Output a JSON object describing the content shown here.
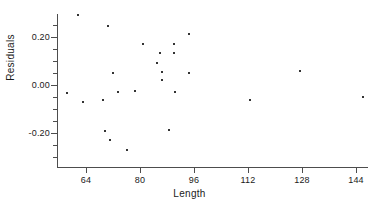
{
  "chart_data": {
    "type": "scatter",
    "title": "",
    "xlabel": "Length",
    "ylabel": "Residuals",
    "xlim": [
      56,
      148
    ],
    "ylim": [
      -0.33,
      0.32
    ],
    "grid": false,
    "legend": null,
    "x_ticks": [
      64,
      80,
      96,
      112,
      128,
      144
    ],
    "x_tick_labels": [
      "64",
      "80",
      "96",
      "112",
      "128",
      "144"
    ],
    "y_ticks": [
      0.2,
      0.0,
      -0.2
    ],
    "y_tick_labels": [
      "0.20",
      "0.00",
      "-0.20"
    ],
    "y_minor_ticks": [
      0.3,
      0.25,
      0.15,
      0.1,
      0.05,
      -0.05,
      -0.1,
      -0.15,
      -0.25,
      -0.3
    ],
    "marker": "dot",
    "marker_color": "#333333",
    "axis_color": "#4d4d4d",
    "background": "#ffffff",
    "points": [
      {
        "x": 58.5,
        "y": -0.035
      },
      {
        "x": 61.5,
        "y": 0.29
      },
      {
        "x": 63.0,
        "y": -0.07
      },
      {
        "x": 69.0,
        "y": -0.062
      },
      {
        "x": 70.5,
        "y": 0.245
      },
      {
        "x": 69.5,
        "y": -0.193
      },
      {
        "x": 72.0,
        "y": 0.05
      },
      {
        "x": 71.0,
        "y": -0.228
      },
      {
        "x": 73.5,
        "y": -0.028
      },
      {
        "x": 76.0,
        "y": -0.272
      },
      {
        "x": 78.5,
        "y": -0.027
      },
      {
        "x": 81.0,
        "y": 0.172
      },
      {
        "x": 85.0,
        "y": 0.092
      },
      {
        "x": 86.0,
        "y": 0.135
      },
      {
        "x": 86.5,
        "y": 0.053
      },
      {
        "x": 86.5,
        "y": 0.02
      },
      {
        "x": 88.5,
        "y": -0.188
      },
      {
        "x": 90.0,
        "y": 0.172
      },
      {
        "x": 90.0,
        "y": 0.133
      },
      {
        "x": 90.5,
        "y": -0.03
      },
      {
        "x": 94.5,
        "y": 0.212
      },
      {
        "x": 94.5,
        "y": 0.052
      },
      {
        "x": 112.5,
        "y": -0.062
      },
      {
        "x": 127.5,
        "y": 0.06
      },
      {
        "x": 146.0,
        "y": -0.052
      }
    ]
  },
  "axis_titles": {
    "x": "Length",
    "y": "Residuals"
  }
}
